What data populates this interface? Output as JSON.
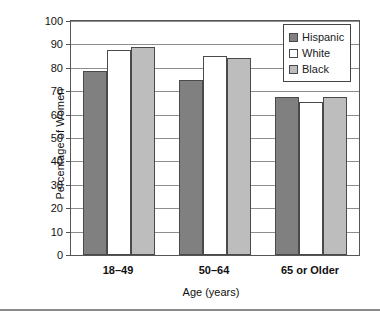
{
  "chart_data": {
    "type": "bar",
    "title": "",
    "subtitle": "",
    "xlabel": "Age (years)",
    "ylabel": "Percentage of Women",
    "categories": [
      "18–49",
      "50–64",
      "65 or Older"
    ],
    "series": [
      {
        "name": "Hispanic",
        "color": "#808080",
        "values": [
          78.5,
          75.0,
          67.5
        ]
      },
      {
        "name": "White",
        "color": "#FFFFFF",
        "values": [
          87.5,
          85.0,
          65.5
        ]
      },
      {
        "name": "Black",
        "color": "#BDBDBD",
        "values": [
          89.0,
          84.0,
          67.5
        ]
      }
    ],
    "ylim": [
      0,
      100
    ],
    "ytick_values": [
      0,
      10,
      20,
      30,
      40,
      50,
      60,
      70,
      80,
      90,
      100
    ],
    "ytick_labels": [
      "0",
      "10",
      "20",
      "30",
      "40",
      "50",
      "60",
      "70",
      "80",
      "90",
      "100"
    ],
    "grid": true,
    "legend_position": "top-right",
    "bar_border_color": "#4a4a4a",
    "axis_color": "#555555",
    "gridline_color": "#8d8d8d"
  },
  "legend": {
    "items": [
      {
        "label": "Hispanic",
        "color": "#808080"
      },
      {
        "label": "White",
        "color": "#FFFFFF"
      },
      {
        "label": "Black",
        "color": "#BDBDBD"
      }
    ]
  }
}
